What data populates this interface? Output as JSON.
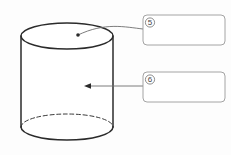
{
  "figure": {
    "type": "cylinder-diagram",
    "title": "",
    "background_color": "#fdfdfd",
    "stroke_color": "#2b2b2b",
    "line_color": "#6e6e6e",
    "box_border_color": "#9a9a9a",
    "fill_color": "#ffffff",
    "shape": {
      "name": "cylinder",
      "label": "cylinder",
      "top_ellipse": {
        "cx": 67,
        "cy": 36,
        "rx": 46,
        "ry": 13,
        "style": "solid"
      },
      "bottom_ellipse": {
        "cx": 67,
        "cy": 127,
        "rx": 46,
        "ry": 13,
        "front_style": "solid",
        "back_style": "dashed"
      },
      "left_edge_x": 21,
      "right_edge_x": 113,
      "body_top_y": 36,
      "body_bottom_y": 127
    },
    "callouts": [
      {
        "marker": "⑤",
        "marker_plain": "5",
        "answer_value": "",
        "answer_placeholder": "",
        "points_to": "top-face",
        "leader": {
          "from_x": 143,
          "from_y": 29,
          "to_x": 78,
          "to_y": 35,
          "style": "curved",
          "endpoint": "dot"
        },
        "box": {
          "x": 143,
          "y": 15,
          "w": 82,
          "h": 30
        }
      },
      {
        "marker": "⑥",
        "marker_plain": "6",
        "answer_value": "",
        "answer_placeholder": "",
        "points_to": "lateral-surface",
        "leader": {
          "from_x": 143,
          "from_y": 86,
          "to_x": 85,
          "to_y": 86,
          "style": "straight",
          "endpoint": "arrowhead"
        },
        "box": {
          "x": 143,
          "y": 72,
          "w": 82,
          "h": 30
        }
      }
    ]
  }
}
